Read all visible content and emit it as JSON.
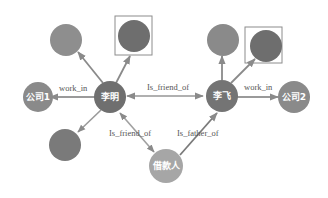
{
  "diagram": {
    "type": "knowledge-graph",
    "colors": {
      "node_dark": "#6e6e6e",
      "node_medium": "#8a8a8a",
      "node_light": "#a8a8a8",
      "edge": "#9a9a9a",
      "highlight_box": "#8c8c8c",
      "edge_label": "#555555"
    },
    "nodes": [
      {
        "id": "liming",
        "label": "李明"
      },
      {
        "id": "lifei",
        "label": "李飞"
      },
      {
        "id": "company1",
        "label": "公司1"
      },
      {
        "id": "company2",
        "label": "公司2"
      },
      {
        "id": "borrower",
        "label": "借款人"
      },
      {
        "id": "liming_top_left",
        "label": ""
      },
      {
        "id": "liming_top_right_boxed",
        "label": ""
      },
      {
        "id": "liming_bottom_left",
        "label": ""
      },
      {
        "id": "lifei_top",
        "label": ""
      },
      {
        "id": "lifei_top_right_boxed",
        "label": ""
      }
    ],
    "edges": [
      {
        "from": "liming",
        "to": "company1",
        "label": "work_in"
      },
      {
        "from": "liming",
        "to": "lifei",
        "label": "Is_friend_of"
      },
      {
        "from": "lifei",
        "to": "company2",
        "label": "work_in"
      },
      {
        "from": "liming",
        "to": "borrower",
        "label": "Is_friend_of"
      },
      {
        "from": "borrower",
        "to": "lifei",
        "label": "Is_father_of"
      },
      {
        "from": "liming",
        "to": "liming_top_left",
        "label": ""
      },
      {
        "from": "liming",
        "to": "liming_top_right_boxed",
        "label": ""
      },
      {
        "from": "liming",
        "to": "liming_bottom_left",
        "label": ""
      },
      {
        "from": "lifei",
        "to": "lifei_top",
        "label": ""
      },
      {
        "from": "lifei",
        "to": "lifei_top_right_boxed",
        "label": ""
      }
    ]
  }
}
